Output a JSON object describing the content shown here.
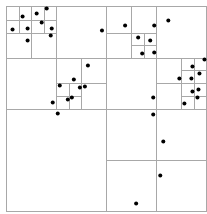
{
  "diagram": {
    "type": "quadtree",
    "colors": {
      "line": "#a8a8a8",
      "point": "#000000",
      "background": "#ffffff"
    },
    "domain": {
      "x": [
        0,
        200
      ],
      "y": [
        0,
        205
      ]
    },
    "cells": [
      [
        0,
        0,
        200,
        205
      ],
      [
        0,
        0,
        100,
        103
      ],
      [
        100,
        0,
        200,
        103
      ],
      [
        0,
        103,
        100,
        205
      ],
      [
        100,
        103,
        200,
        205
      ],
      [
        0,
        0,
        50,
        52
      ],
      [
        50,
        0,
        100,
        52
      ],
      [
        0,
        52,
        50,
        103
      ],
      [
        50,
        52,
        100,
        103
      ],
      [
        0,
        0,
        25,
        27
      ],
      [
        25,
        0,
        50,
        27
      ],
      [
        0,
        27,
        25,
        52
      ],
      [
        25,
        27,
        50,
        52
      ],
      [
        0,
        0,
        13,
        14
      ],
      [
        13,
        0,
        25,
        14
      ],
      [
        0,
        14,
        13,
        27
      ],
      [
        13,
        14,
        25,
        27
      ],
      [
        25,
        0,
        38,
        14
      ],
      [
        38,
        0,
        50,
        14
      ],
      [
        25,
        14,
        38,
        27
      ],
      [
        38,
        14,
        50,
        27
      ],
      [
        50,
        52,
        75,
        77
      ],
      [
        75,
        52,
        100,
        77
      ],
      [
        50,
        77,
        75,
        103
      ],
      [
        75,
        77,
        100,
        103
      ],
      [
        50,
        77,
        63,
        90
      ],
      [
        63,
        77,
        75,
        90
      ],
      [
        50,
        90,
        63,
        103
      ],
      [
        63,
        90,
        75,
        103
      ],
      [
        100,
        0,
        150,
        52
      ],
      [
        150,
        0,
        200,
        52
      ],
      [
        100,
        52,
        150,
        103
      ],
      [
        150,
        52,
        200,
        103
      ],
      [
        100,
        0,
        125,
        27
      ],
      [
        125,
        0,
        150,
        27
      ],
      [
        100,
        27,
        125,
        52
      ],
      [
        125,
        27,
        150,
        52
      ],
      [
        125,
        27,
        138,
        39
      ],
      [
        138,
        27,
        150,
        39
      ],
      [
        125,
        39,
        138,
        52
      ],
      [
        138,
        39,
        150,
        52
      ],
      [
        150,
        52,
        175,
        77
      ],
      [
        175,
        52,
        200,
        77
      ],
      [
        150,
        77,
        175,
        103
      ],
      [
        175,
        77,
        200,
        103
      ],
      [
        175,
        52,
        188,
        64
      ],
      [
        188,
        52,
        200,
        64
      ],
      [
        175,
        64,
        188,
        77
      ],
      [
        188,
        64,
        200,
        77
      ],
      [
        175,
        77,
        188,
        90
      ],
      [
        188,
        77,
        200,
        90
      ],
      [
        175,
        90,
        188,
        103
      ],
      [
        188,
        90,
        200,
        103
      ],
      [
        100,
        103,
        150,
        154
      ],
      [
        150,
        103,
        200,
        154
      ],
      [
        100,
        154,
        150,
        205
      ],
      [
        150,
        154,
        200,
        205
      ]
    ],
    "points": [
      [
        17,
        11
      ],
      [
        31,
        8
      ],
      [
        41,
        3
      ],
      [
        7,
        24
      ],
      [
        22,
        23
      ],
      [
        36,
        17
      ],
      [
        46,
        23
      ],
      [
        45,
        30
      ],
      [
        22,
        35
      ],
      [
        96,
        25
      ],
      [
        119,
        20
      ],
      [
        148,
        20
      ],
      [
        162,
        15
      ],
      [
        132,
        32
      ],
      [
        144,
        35
      ],
      [
        136,
        48
      ],
      [
        148,
        47
      ],
      [
        198,
        54
      ],
      [
        186,
        61
      ],
      [
        193,
        68
      ],
      [
        173,
        73
      ],
      [
        185,
        73
      ],
      [
        186,
        86
      ],
      [
        192,
        84
      ],
      [
        178,
        98
      ],
      [
        191,
        92
      ],
      [
        147,
        92
      ],
      [
        82,
        60
      ],
      [
        68,
        74
      ],
      [
        54,
        80
      ],
      [
        74,
        82
      ],
      [
        79,
        81
      ],
      [
        47,
        97
      ],
      [
        62,
        94
      ],
      [
        66,
        92
      ],
      [
        52,
        108
      ],
      [
        147,
        109
      ],
      [
        157,
        136
      ],
      [
        154,
        170
      ],
      [
        130,
        198
      ]
    ]
  }
}
